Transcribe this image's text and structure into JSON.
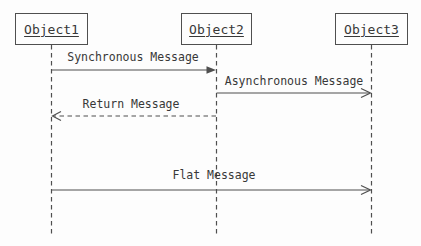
{
  "diagram": {
    "type": "uml-sequence-diagram",
    "objects": [
      {
        "name": "Object1"
      },
      {
        "name": "Object2"
      },
      {
        "name": "Object3"
      }
    ],
    "messages": [
      {
        "label": "Synchronous Message",
        "from": "Object1",
        "to": "Object2",
        "line": "solid",
        "arrowhead": "filled"
      },
      {
        "label": "Asynchronous Message",
        "from": "Object2",
        "to": "Object3",
        "line": "solid",
        "arrowhead": "open"
      },
      {
        "label": "Return Message",
        "from": "Object2",
        "to": "Object1",
        "line": "dashed",
        "arrowhead": "open"
      },
      {
        "label": "Flat Message",
        "from": "Object1",
        "to": "Object3",
        "line": "solid",
        "arrowhead": "open"
      }
    ],
    "colors": {
      "line": "#4f4f4f",
      "text": "#383838",
      "background": "#fdfdfd"
    }
  }
}
